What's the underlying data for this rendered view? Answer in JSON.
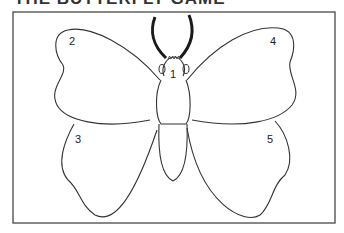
{
  "title": "THE BUTTERFLY GAME",
  "diagram": {
    "type": "butterfly-outline",
    "parts": [
      {
        "number": "1",
        "name": "body-and-head"
      },
      {
        "number": "2",
        "name": "upper-left-wing"
      },
      {
        "number": "3",
        "name": "lower-left-wing"
      },
      {
        "number": "4",
        "name": "upper-right-wing"
      },
      {
        "number": "5",
        "name": "lower-right-wing"
      }
    ],
    "colors": {
      "line": "#333333",
      "antennae": "#1a1a1a",
      "background": "#ffffff"
    }
  }
}
